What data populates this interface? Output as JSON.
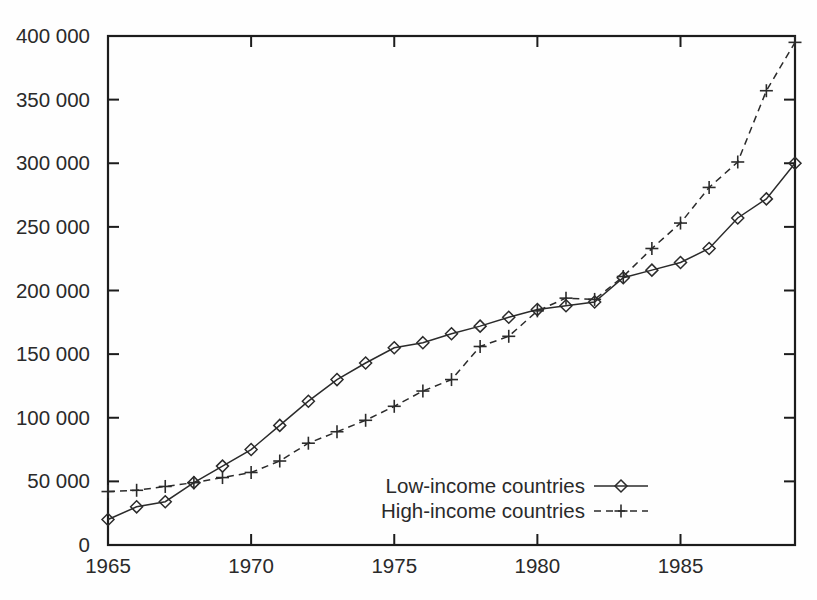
{
  "chart_data": {
    "type": "line",
    "title": "",
    "subtitle": "",
    "xlabel": "",
    "ylabel": "",
    "xlim": [
      1965,
      1989
    ],
    "ylim": [
      0,
      400000
    ],
    "grid": false,
    "legend_position": "inside-bottom-center",
    "x_tick_labels": [
      "1965",
      "1970",
      "1975",
      "1980",
      "1985"
    ],
    "x_ticks": [
      1965,
      1970,
      1975,
      1980,
      1985
    ],
    "y_tick_labels": [
      "0",
      "50 000",
      "100 000",
      "150 000",
      "200 000",
      "250 000",
      "300 000",
      "350 000",
      "400 000"
    ],
    "y_ticks": [
      0,
      50000,
      100000,
      150000,
      200000,
      250000,
      300000,
      350000,
      400000
    ],
    "x": [
      1965,
      1966,
      1967,
      1968,
      1969,
      1970,
      1971,
      1972,
      1973,
      1974,
      1975,
      1976,
      1977,
      1978,
      1979,
      1980,
      1981,
      1982,
      1983,
      1984,
      1985,
      1986,
      1987,
      1988,
      1989
    ],
    "series": [
      {
        "name": "Low-income countries",
        "marker": "diamond",
        "linestyle": "solid",
        "color": "#2b2b2b",
        "values": [
          20000,
          30000,
          34000,
          49000,
          62000,
          75000,
          94000,
          113000,
          130000,
          143000,
          155000,
          159000,
          166000,
          172000,
          179000,
          185000,
          188000,
          191000,
          210000,
          216000,
          222000,
          233000,
          257000,
          272000,
          300000
        ]
      },
      {
        "name": "High-income countries",
        "marker": "plus",
        "linestyle": "dashed",
        "color": "#2b2b2b",
        "values": [
          42000,
          43000,
          46000,
          49000,
          53000,
          57000,
          66000,
          80000,
          89000,
          98000,
          109000,
          121000,
          130000,
          156000,
          164000,
          184000,
          194000,
          193000,
          211000,
          233000,
          253000,
          281000,
          301000,
          357000,
          395000
        ]
      }
    ],
    "legend": [
      {
        "label": "Low-income countries",
        "marker": "diamond",
        "linestyle": "solid"
      },
      {
        "label": "High-income countries",
        "marker": "plus",
        "linestyle": "dashed"
      }
    ],
    "colors": {
      "axis": "#1c1c1c",
      "text": "#2a2a2a",
      "series": "#2b2b2b",
      "background": "#fefefe"
    }
  }
}
